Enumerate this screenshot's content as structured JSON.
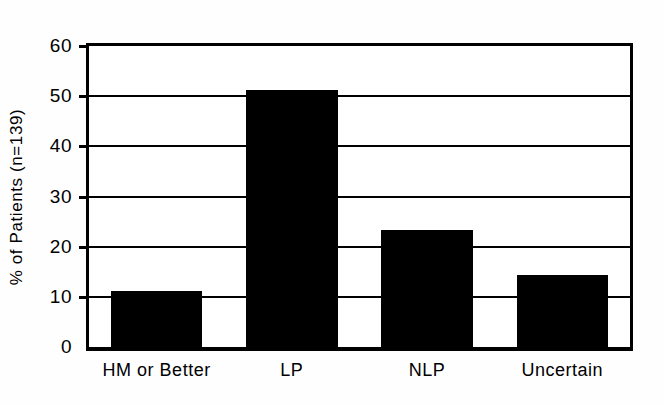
{
  "chart_data": {
    "type": "bar",
    "title": "",
    "xlabel": "",
    "ylabel": "% of Patients (n=139)",
    "categories": [
      "HM or Better",
      "LP",
      "NLP",
      "Uncertain"
    ],
    "values": [
      11.2,
      51.3,
      23.3,
      14.4
    ],
    "ylim": [
      0,
      60
    ],
    "yticks": [
      0,
      10,
      20,
      30,
      40,
      50,
      60
    ],
    "ytick_labels": [
      "0",
      "10",
      "20",
      "30",
      "40",
      "50",
      "60"
    ],
    "grid": true,
    "grid_axis": "y",
    "legend": null,
    "bar_color": "#000000",
    "background_color": "#ffffff",
    "axis_color": "#000000"
  },
  "axis": {
    "y_title": "% of Patients (n=139)"
  }
}
